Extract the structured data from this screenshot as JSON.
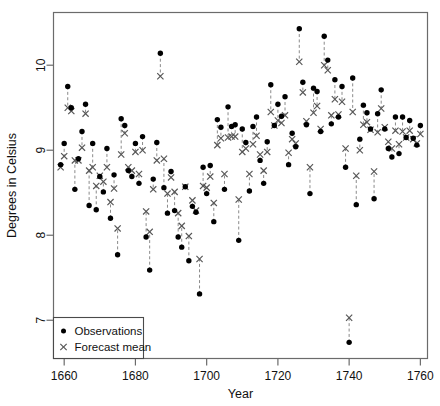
{
  "chart_data": {
    "type": "scatter",
    "title": "",
    "xlabel": "Year",
    "ylabel": "Degrees in Celsius",
    "xlim": [
      1657,
      1762
    ],
    "ylim": [
      6.55,
      10.62
    ],
    "xticks": [
      1660,
      1680,
      1700,
      1720,
      1740,
      1760
    ],
    "xtick_labels": [
      "1660",
      "1680",
      "1700",
      "1720",
      "1740",
      "1760"
    ],
    "yticks": [
      7,
      8,
      9,
      10
    ],
    "ytick_labels": [
      "7",
      "8",
      "9",
      "10"
    ],
    "grid": false,
    "legend_position": "bottom-left",
    "legend": [
      {
        "label": "Observations",
        "marker": "filled-circle",
        "color": "#000000"
      },
      {
        "label": "Forecast mean",
        "marker": "cross-x",
        "color": "#555555"
      }
    ],
    "series": [
      {
        "name": "Observations",
        "marker": "filled-circle",
        "color": "#000000",
        "x": [
          1659,
          1660,
          1661,
          1662,
          1663,
          1664,
          1665,
          1666,
          1667,
          1668,
          1669,
          1670,
          1671,
          1672,
          1673,
          1674,
          1675,
          1676,
          1677,
          1678,
          1679,
          1680,
          1681,
          1682,
          1683,
          1684,
          1685,
          1686,
          1687,
          1688,
          1689,
          1690,
          1691,
          1692,
          1693,
          1694,
          1695,
          1696,
          1697,
          1698,
          1699,
          1700,
          1701,
          1702,
          1703,
          1704,
          1705,
          1706,
          1707,
          1708,
          1709,
          1710,
          1711,
          1712,
          1713,
          1714,
          1715,
          1716,
          1717,
          1718,
          1719,
          1720,
          1721,
          1722,
          1723,
          1724,
          1725,
          1726,
          1727,
          1728,
          1729,
          1730,
          1731,
          1732,
          1733,
          1734,
          1735,
          1736,
          1737,
          1738,
          1739,
          1740,
          1741,
          1742,
          1743,
          1744,
          1745,
          1746,
          1747,
          1748,
          1749,
          1750,
          1751,
          1752,
          1753,
          1754,
          1755,
          1756,
          1757,
          1758,
          1759,
          1760
        ],
        "y": [
          8.83,
          9.08,
          9.75,
          9.5,
          8.54,
          8.9,
          9.22,
          9.54,
          8.35,
          9.08,
          8.3,
          8.69,
          8.51,
          9.02,
          8.2,
          8.71,
          7.77,
          9.37,
          9.29,
          8.76,
          8.69,
          9.08,
          8.61,
          9.16,
          7.98,
          7.59,
          8.66,
          9.09,
          10.14,
          8.56,
          8.26,
          8.75,
          8.29,
          7.98,
          7.86,
          8.57,
          7.7,
          8.34,
          8.27,
          7.31,
          8.8,
          8.49,
          8.82,
          8.16,
          9.36,
          9.27,
          8.54,
          9.51,
          9.28,
          9.3,
          7.94,
          9.25,
          9.09,
          8.52,
          9.28,
          9.39,
          8.88,
          8.61,
          9.1,
          9.77,
          9.29,
          9.54,
          9.4,
          9.63,
          8.83,
          9.2,
          9.04,
          10.43,
          9.8,
          9.3,
          8.49,
          9.73,
          9.69,
          9.22,
          10.34,
          10.06,
          9.31,
          9.83,
          9.39,
          9.75,
          8.8,
          6.74,
          9.85,
          8.36,
          9.13,
          9.53,
          9.44,
          9.25,
          8.43,
          9.43,
          9.71,
          9.25,
          9.02,
          8.92,
          9.39,
          8.96,
          9.39,
          9.15,
          9.35,
          9.14,
          9.06,
          9.29
        ]
      },
      {
        "name": "Forecast mean",
        "marker": "cross-x",
        "color": "#555555",
        "x": [
          1659,
          1660,
          1661,
          1662,
          1663,
          1664,
          1665,
          1666,
          1667,
          1668,
          1669,
          1670,
          1671,
          1672,
          1673,
          1674,
          1675,
          1676,
          1677,
          1678,
          1679,
          1680,
          1681,
          1682,
          1683,
          1684,
          1685,
          1686,
          1687,
          1688,
          1689,
          1690,
          1691,
          1692,
          1693,
          1694,
          1695,
          1696,
          1697,
          1698,
          1699,
          1700,
          1701,
          1702,
          1703,
          1704,
          1705,
          1706,
          1707,
          1708,
          1709,
          1710,
          1711,
          1712,
          1713,
          1714,
          1715,
          1716,
          1717,
          1718,
          1719,
          1720,
          1721,
          1722,
          1723,
          1724,
          1725,
          1726,
          1727,
          1728,
          1729,
          1730,
          1731,
          1732,
          1733,
          1734,
          1735,
          1736,
          1737,
          1738,
          1739,
          1740,
          1741,
          1742,
          1743,
          1744,
          1745,
          1746,
          1747,
          1748,
          1749,
          1750,
          1751,
          1752,
          1753,
          1754,
          1755,
          1756,
          1757,
          1758,
          1759,
          1760
        ],
        "y": [
          8.8,
          8.93,
          9.5,
          9.46,
          8.88,
          8.88,
          9.03,
          9.43,
          8.76,
          8.8,
          8.58,
          8.7,
          8.63,
          8.8,
          8.39,
          8.55,
          8.08,
          8.95,
          9.2,
          8.8,
          8.76,
          8.98,
          8.72,
          9.0,
          8.28,
          8.04,
          8.54,
          8.88,
          9.87,
          8.9,
          8.49,
          8.68,
          8.51,
          8.26,
          8.11,
          8.57,
          7.99,
          8.41,
          8.29,
          7.72,
          8.58,
          8.56,
          8.69,
          8.38,
          9.06,
          9.14,
          8.72,
          9.15,
          9.16,
          9.16,
          8.42,
          8.98,
          9.02,
          8.72,
          9.07,
          9.17,
          8.95,
          8.76,
          8.98,
          9.45,
          9.29,
          9.35,
          9.32,
          9.41,
          8.97,
          9.13,
          9.08,
          10.04,
          9.68,
          9.34,
          8.8,
          9.44,
          9.52,
          9.25,
          10.0,
          9.94,
          9.41,
          9.6,
          9.42,
          9.57,
          9.02,
          7.03,
          9.45,
          8.7,
          9.0,
          9.3,
          9.33,
          9.24,
          8.75,
          9.21,
          9.49,
          9.27,
          9.1,
          9.02,
          9.23,
          9.07,
          9.22,
          9.15,
          9.23,
          9.13,
          9.08,
          9.19
        ]
      }
    ]
  }
}
